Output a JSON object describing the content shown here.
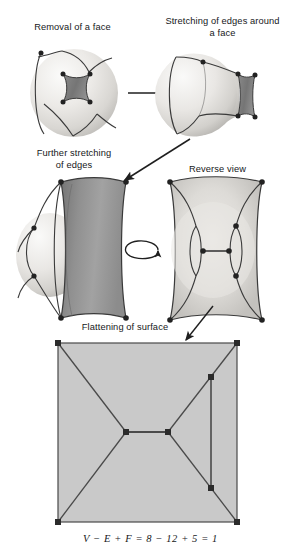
{
  "figure": {
    "background_color": "#ffffff",
    "width": 301,
    "height": 559
  },
  "captions": {
    "step1": "Removal of a face",
    "step2": "Stretching of edges around\na face",
    "step3": "Further stretching\nof edges",
    "step4": "Reverse view",
    "step5": "Flattening of surface"
  },
  "formula": {
    "text": "V − E + F = 8 − 12 + 5 = 1",
    "vertices": 8,
    "edges": 12,
    "faces": 5,
    "result": 1
  },
  "colors": {
    "sphere_light": "#f2f1ef",
    "sphere_mid": "#dcdbd8",
    "sphere_shadow": "#b9b8b4",
    "removed_face": "#6f6f6f",
    "stretched_face": "#8d8d8d",
    "flat_fill": "#c9c9c9",
    "edge_stroke": "#3a3a3a",
    "vertex_fill": "#2b2b2b",
    "arrow_stroke": "#1f1f1f",
    "text": "#16181a"
  },
  "diagrams": {
    "sphere1": {
      "name": "sphere-with-removed-face",
      "cx": 74,
      "cy": 93,
      "r": 44,
      "vertex_count": 4,
      "face_label": "removed face"
    },
    "sphere2": {
      "name": "sphere-stretched-edges",
      "cx": 205,
      "cy": 96,
      "r": 42,
      "vertex_count": 8
    },
    "sphere3": {
      "name": "sphere-further-stretched",
      "cx": 55,
      "cy": 250,
      "r": 40,
      "vertex_count": 8
    },
    "sphere4": {
      "name": "sphere-reverse-view",
      "cx": 215,
      "cy": 250,
      "r": 48,
      "vertex_count": 8
    },
    "flat": {
      "name": "flattened-planar-graph",
      "left": 58,
      "top": 343,
      "right": 237,
      "bottom": 522,
      "corners": [
        [
          58,
          343
        ],
        [
          237,
          343
        ],
        [
          237,
          522
        ],
        [
          58,
          522
        ]
      ],
      "inner_vertices": [
        [
          126,
          432
        ],
        [
          168,
          432
        ],
        [
          211,
          377
        ],
        [
          211,
          488
        ]
      ],
      "regions": 5
    }
  },
  "arrows": {
    "a1": {
      "name": "arrow-step1-to-step2",
      "from": [
        128,
        93
      ],
      "to": [
        170,
        93
      ],
      "type": "straight"
    },
    "a2": {
      "name": "arrow-step2-to-step3",
      "from": [
        185,
        135
      ],
      "to": [
        125,
        178
      ],
      "type": "straight"
    },
    "a3": {
      "name": "arrow-rotate-step3-to-step4",
      "cx": 140,
      "cy": 251,
      "type": "rotation-ellipse"
    },
    "a4": {
      "name": "arrow-step4-to-step5",
      "from": [
        211,
        308
      ],
      "to": [
        186,
        341
      ],
      "type": "straight"
    }
  }
}
